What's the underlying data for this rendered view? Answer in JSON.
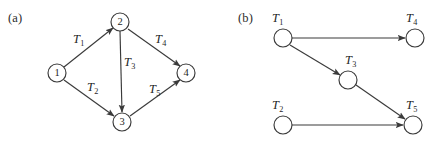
{
  "figure": {
    "width": 435,
    "height": 145,
    "background": "#ffffff",
    "stroke_color": "#3a3a3a",
    "text_color": "#1f1f1f"
  },
  "panels": [
    {
      "id": "a",
      "label": "(a)",
      "label_x": 8,
      "label_y": 11,
      "caption": "task precedence graph with numbered nodes",
      "nodes": [
        {
          "name": "node-1",
          "text": "1",
          "cx": 57,
          "cy": 73,
          "r": 9
        },
        {
          "name": "node-2",
          "text": "2",
          "cx": 120,
          "cy": 22,
          "r": 9
        },
        {
          "name": "node-3",
          "text": "3",
          "cx": 122,
          "cy": 122,
          "r": 9
        },
        {
          "name": "node-4",
          "text": "4",
          "cx": 186,
          "cy": 73,
          "r": 9
        }
      ],
      "edges": [
        {
          "name": "edge-1-2",
          "from": "1",
          "to": "2",
          "x1": 64,
          "y1": 67,
          "x2": 113,
          "y2": 28
        },
        {
          "name": "edge-1-3",
          "from": "1",
          "to": "3",
          "x1": 64,
          "y1": 80,
          "x2": 114,
          "y2": 116
        },
        {
          "name": "edge-2-3",
          "from": "2",
          "to": "3",
          "x1": 120,
          "y1": 31,
          "x2": 122,
          "y2": 112
        },
        {
          "name": "edge-2-4",
          "from": "2",
          "to": "4",
          "x1": 128,
          "y1": 29,
          "x2": 180,
          "y2": 66
        },
        {
          "name": "edge-3-4",
          "from": "3",
          "to": "4",
          "x1": 130,
          "y1": 116,
          "x2": 180,
          "y2": 80
        }
      ],
      "edge_labels": [
        {
          "name": "edge-label-T1",
          "base": "T",
          "sub": "1",
          "x": 73,
          "y": 33
        },
        {
          "name": "edge-label-T2",
          "base": "T",
          "sub": "2",
          "x": 87,
          "y": 81
        },
        {
          "name": "edge-label-T3",
          "base": "T",
          "sub": "3",
          "x": 124,
          "y": 56
        },
        {
          "name": "edge-label-T4",
          "base": "T",
          "sub": "4",
          "x": 155,
          "y": 33
        },
        {
          "name": "edge-label-T5",
          "base": "T",
          "sub": "5",
          "x": 149,
          "y": 83
        }
      ]
    },
    {
      "id": "b",
      "label": "(b)",
      "label_x": 238,
      "label_y": 11,
      "caption": "task schedule graph with T-labelled nodes",
      "nodes": [
        {
          "name": "node-T1",
          "text": "",
          "cx": 283,
          "cy": 38,
          "r": 9
        },
        {
          "name": "node-T4",
          "text": "",
          "cx": 415,
          "cy": 38,
          "r": 9
        },
        {
          "name": "node-T3",
          "text": "",
          "cx": 348,
          "cy": 80,
          "r": 9
        },
        {
          "name": "node-T2",
          "text": "",
          "cx": 283,
          "cy": 125,
          "r": 9
        },
        {
          "name": "node-T5",
          "text": "",
          "cx": 413,
          "cy": 125,
          "r": 9
        }
      ],
      "edges": [
        {
          "name": "edge-T1-T4",
          "from": "T1",
          "to": "T4",
          "x1": 292,
          "y1": 38,
          "x2": 405,
          "y2": 38
        },
        {
          "name": "edge-T1-T3",
          "from": "T1",
          "to": "T3",
          "x1": 290,
          "y1": 45,
          "x2": 340,
          "y2": 75
        },
        {
          "name": "edge-T3-T5",
          "from": "T3",
          "to": "T5",
          "x1": 356,
          "y1": 85,
          "x2": 405,
          "y2": 119
        },
        {
          "name": "edge-T2-T5",
          "from": "T2",
          "to": "T5",
          "x1": 292,
          "y1": 125,
          "x2": 403,
          "y2": 125
        }
      ],
      "node_labels": [
        {
          "name": "node-label-T1",
          "base": "T",
          "sub": "1",
          "x": 272,
          "y": 12
        },
        {
          "name": "node-label-T4",
          "base": "T",
          "sub": "4",
          "x": 406,
          "y": 12
        },
        {
          "name": "node-label-T3",
          "base": "T",
          "sub": "3",
          "x": 345,
          "y": 54
        },
        {
          "name": "node-label-T2",
          "base": "T",
          "sub": "2",
          "x": 272,
          "y": 99
        },
        {
          "name": "node-label-T5",
          "base": "T",
          "sub": "5",
          "x": 406,
          "y": 99
        }
      ]
    }
  ]
}
